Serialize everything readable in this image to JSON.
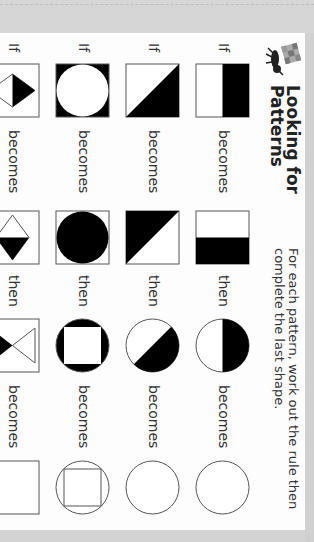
{
  "header": {
    "title_line1": "Looking for",
    "title_line2": "Patterns",
    "instruction_line1": "For each pattern, work out the rule then",
    "instruction_line2": "complete the last shape.",
    "logo_icon": "ant-with-box-icon"
  },
  "labels": {
    "if": "If",
    "becomes": "becomes",
    "then": "then"
  },
  "colors": {
    "ink": "#000000",
    "outline": "#555555",
    "panel": "#fdfdfd",
    "background": "#d6d6d6"
  },
  "rows": [
    {
      "shapes": [
        "square-top-half-black",
        "square-right-half-black",
        "circle-top-half-black",
        "empty-circle"
      ]
    },
    {
      "shapes": [
        "square-top-right-triangle-black",
        "square-bottom-left-triangle-black",
        "circle-top-right-half-black",
        "empty-circle"
      ]
    },
    {
      "shapes": [
        "black-square-white-circle",
        "white-square-black-circle",
        "black-circle-white-square",
        "circle-with-square-outline"
      ]
    },
    {
      "shapes": [
        "diamond-top-half-black",
        "diamond-right-half-black",
        "hourglass-bottom-black",
        "empty-square"
      ]
    }
  ]
}
